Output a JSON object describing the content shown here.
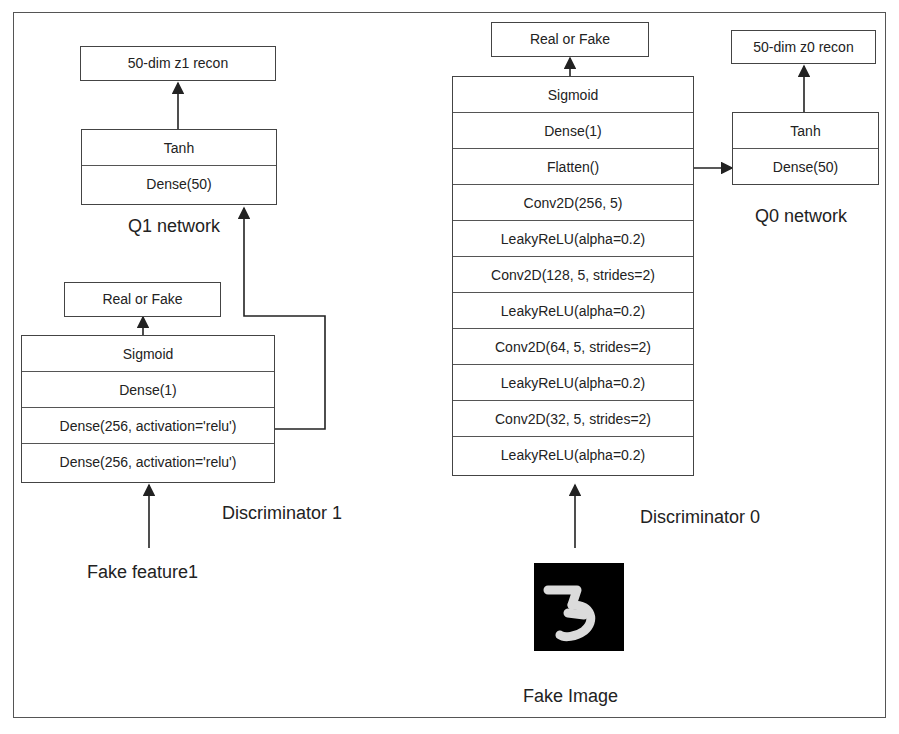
{
  "q1": {
    "output": "50-dim z1 recon",
    "layers": [
      "Tanh",
      "Dense(50)"
    ],
    "title": "Q1 network"
  },
  "d1": {
    "output": "Real or Fake",
    "layers": [
      "Sigmoid",
      "Dense(1)",
      "Dense(256, activation='relu')",
      "Dense(256, activation='relu')"
    ],
    "title": "Discriminator 1",
    "input": "Fake feature1"
  },
  "d0": {
    "output": "Real or Fake",
    "layers": [
      "Sigmoid",
      "Dense(1)",
      "Flatten()",
      "Conv2D(256, 5)",
      "LeakyReLU(alpha=0.2)",
      "Conv2D(128, 5, strides=2)",
      "LeakyReLU(alpha=0.2)",
      "Conv2D(64, 5, strides=2)",
      "LeakyReLU(alpha=0.2)",
      "Conv2D(32, 5, strides=2)",
      "LeakyReLU(alpha=0.2)"
    ],
    "title": "Discriminator 0",
    "input": "Fake Image",
    "input_image_digit": "3"
  },
  "q0": {
    "output": "50-dim z0 recon",
    "layers": [
      "Tanh",
      "Dense(50)"
    ],
    "title": "Q0 network"
  }
}
